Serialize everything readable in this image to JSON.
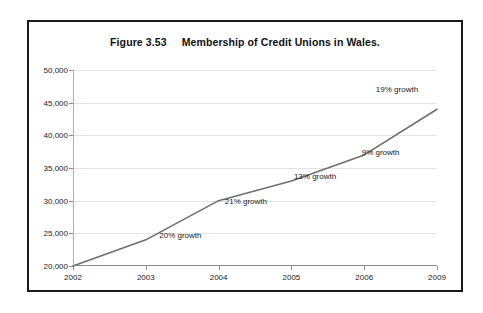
{
  "figure": {
    "title": "Figure 3.53     Membership of Credit Unions in Wales."
  },
  "colors": {
    "frame": "#1a1a1a",
    "series_line": "#6e6e6e",
    "grid": "#e3e3e3",
    "axis": "#8a8a8a",
    "text": "#1a1a1a",
    "plot_background": "#ffffff"
  },
  "chart_data": {
    "type": "line",
    "title": "Figure 3.53     Membership of Credit Unions in Wales.",
    "xlabel": "",
    "ylabel": "",
    "categories": [
      "2002",
      "2003",
      "2004",
      "2005",
      "2006",
      "2009"
    ],
    "values": [
      20000,
      24000,
      30000,
      33000,
      37000,
      44000
    ],
    "series": [
      {
        "name": "Membership of Credit Unions in Wales",
        "values": [
          20000,
          24000,
          30000,
          33000,
          37000,
          44000
        ]
      }
    ],
    "ylim": [
      20000,
      50000
    ],
    "ytick_values": [
      20000,
      25000,
      30000,
      35000,
      40000,
      45000,
      50000
    ],
    "ytick_labels": [
      "20,000",
      "25,000",
      "30,000",
      "35,000",
      "40,000",
      "45,000",
      "50,000"
    ],
    "xtick_labels": [
      "2002",
      "2003",
      "2004",
      "2005",
      "2006",
      "2009"
    ],
    "grid": true,
    "grid_axis": "y",
    "legend": false,
    "legend_position": "none",
    "annotations": [
      {
        "text": "20% growth",
        "x_pct": 29.5,
        "y_pct": 84.0
      },
      {
        "text": "21% growth",
        "x_pct": 47.5,
        "y_pct": 67.0
      },
      {
        "text": "13% growth",
        "x_pct": 66.5,
        "y_pct": 54.0
      },
      {
        "text": "9% growth",
        "x_pct": 84.5,
        "y_pct": 42.0
      },
      {
        "text": "19% growth",
        "x_pct": 89.0,
        "y_pct": 9.5
      }
    ]
  }
}
